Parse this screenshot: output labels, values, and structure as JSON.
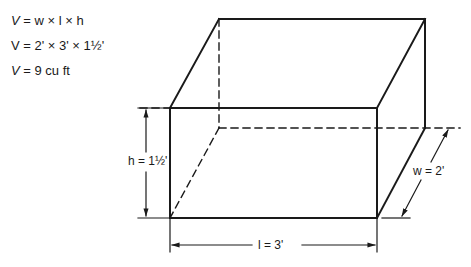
{
  "formulas": {
    "line1": {
      "lhs": "V",
      "rhs": "= w × l × h"
    },
    "line2": {
      "lhs": "V",
      "rhs": "= 2' × 3' × 1½'"
    },
    "line3": {
      "lhs": "V",
      "rhs": "= 9 cu ft"
    }
  },
  "dimensions": {
    "height": "h = 1½'",
    "width": "w = 2'",
    "length": "l = 3'"
  },
  "colors": {
    "stroke": "#1a1a1a",
    "background": "#ffffff"
  }
}
